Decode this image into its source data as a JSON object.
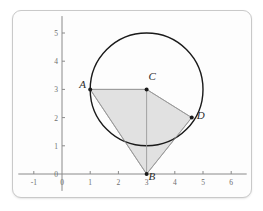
{
  "figure": {
    "title": "",
    "background_color": "#fdfdfd",
    "border_color": "#c9c9c9"
  },
  "chart_data": {
    "type": "scatter",
    "title": "",
    "xlabel": "",
    "ylabel": "",
    "xlim": [
      -1.55,
      6.55
    ],
    "ylim": [
      -0.6,
      5.6
    ],
    "grid": false,
    "xticks": [
      "-1",
      "0",
      "1",
      "2",
      "3",
      "4",
      "5",
      "6"
    ],
    "xtick_values": [
      -1,
      0,
      1,
      2,
      3,
      4,
      5,
      6
    ],
    "yticks": [
      "0",
      "1",
      "2",
      "3",
      "4",
      "5"
    ],
    "ytick_values": [
      0,
      1,
      2,
      3,
      4,
      5
    ],
    "points": [
      {
        "label": "A",
        "x": 1,
        "y": 3,
        "label_dx": -11,
        "label_dy": -5
      },
      {
        "label": "C",
        "x": 3,
        "y": 3,
        "label_dx": 2,
        "label_dy": -13
      },
      {
        "label": "D",
        "x": 4.6,
        "y": 2,
        "label_dx": 5,
        "label_dy": -3
      },
      {
        "label": "B",
        "x": 3,
        "y": 0,
        "label_dx": 2,
        "label_dy": 2
      }
    ],
    "circle": {
      "center_x": 3,
      "center_y": 3,
      "radius": 2,
      "stroke": "#1a1a1a"
    },
    "shaded_polygon": {
      "vertices": [
        [
          1,
          3
        ],
        [
          3,
          3
        ],
        [
          4.6,
          2
        ],
        [
          3,
          0
        ]
      ],
      "fill": "#dcdcdc",
      "stroke": "#9a9a9a"
    },
    "segments": [
      {
        "from": "A",
        "to": "C",
        "x1": 1,
        "y1": 3,
        "x2": 3,
        "y2": 3
      },
      {
        "from": "C",
        "to": "D",
        "x1": 3,
        "y1": 3,
        "x2": 4.6,
        "y2": 2
      },
      {
        "from": "C",
        "to": "B",
        "x1": 3,
        "y1": 3,
        "x2": 3,
        "y2": 0
      },
      {
        "from": "A",
        "to": "B",
        "x1": 1,
        "y1": 3,
        "x2": 3,
        "y2": 0
      },
      {
        "from": "D",
        "to": "B",
        "x1": 4.6,
        "y1": 2,
        "x2": 3,
        "y2": 0
      }
    ],
    "axis_color": "#8a8a8a",
    "tick_color": "#8a8a8a",
    "point_color": "#1a1a1a"
  }
}
